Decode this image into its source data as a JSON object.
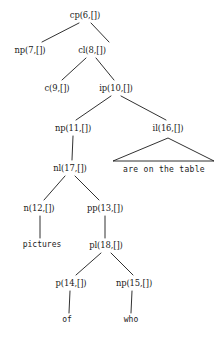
{
  "figure": {
    "type": "syntax-parse-tree",
    "width": 219,
    "height": 338,
    "background": "#ffffff",
    "line_color": "#1a1a1a",
    "text_color": "#1a1a1a"
  },
  "nodes": {
    "cp6": {
      "label": "cp(6,[])",
      "x": 85,
      "y": 15
    },
    "np7": {
      "label": "np(7,[])",
      "x": 30,
      "y": 50
    },
    "cl8": {
      "label": "cl(8,[])",
      "x": 92,
      "y": 50
    },
    "c9": {
      "label": "c(9,[])",
      "x": 57,
      "y": 88
    },
    "ip10": {
      "label": "ip(10,[])",
      "x": 116,
      "y": 88
    },
    "np11": {
      "label": "np(11,[])",
      "x": 73,
      "y": 128
    },
    "il16": {
      "label": "il(16,[])",
      "x": 168,
      "y": 128
    },
    "nl17": {
      "label": "nl(17,[])",
      "x": 70,
      "y": 168
    },
    "n12": {
      "label": "n(12,[])",
      "x": 39,
      "y": 208
    },
    "pp13": {
      "label": "pp(13,[])",
      "x": 105,
      "y": 208
    },
    "pictures": {
      "label": "pictures",
      "x": 42,
      "y": 245
    },
    "pl18": {
      "label": "pl(18,[])",
      "x": 106,
      "y": 245
    },
    "p14": {
      "label": "p(14,[])",
      "x": 71,
      "y": 283
    },
    "np15": {
      "label": "np(15,[])",
      "x": 134,
      "y": 283
    },
    "of": {
      "label": "of",
      "x": 67,
      "y": 320
    },
    "who": {
      "label": "who",
      "x": 131,
      "y": 320
    }
  },
  "phrase_triangle": {
    "text": "are on the table",
    "apex_x": 168,
    "apex_y": 138,
    "base_left_x": 113,
    "base_right_x": 214,
    "base_y": 161,
    "text_x": 164,
    "text_y": 170
  },
  "edges": [
    {
      "from": "cp6",
      "to": "np7"
    },
    {
      "from": "cp6",
      "to": "cl8"
    },
    {
      "from": "cl8",
      "to": "c9"
    },
    {
      "from": "cl8",
      "to": "ip10"
    },
    {
      "from": "ip10",
      "to": "np11"
    },
    {
      "from": "ip10",
      "to": "il16"
    },
    {
      "from": "np11",
      "to": "nl17"
    },
    {
      "from": "nl17",
      "to": "n12"
    },
    {
      "from": "nl17",
      "to": "pp13"
    },
    {
      "from": "n12",
      "to": "pictures"
    },
    {
      "from": "pp13",
      "to": "pl18"
    },
    {
      "from": "pl18",
      "to": "p14"
    },
    {
      "from": "pl18",
      "to": "np15"
    },
    {
      "from": "p14",
      "to": "of"
    },
    {
      "from": "np15",
      "to": "who"
    }
  ],
  "lines": [
    {
      "name": "edge-cp6-np7",
      "x1": 79,
      "y1": 23,
      "x2": 42,
      "y2": 42
    },
    {
      "name": "edge-cp6-cl8",
      "x1": 91,
      "y1": 23,
      "x2": 109,
      "y2": 42
    },
    {
      "name": "edge-cl8-c9",
      "x1": 86,
      "y1": 58,
      "x2": 62,
      "y2": 80
    },
    {
      "name": "edge-cl8-ip10",
      "x1": 96,
      "y1": 58,
      "x2": 114,
      "y2": 80
    },
    {
      "name": "edge-ip10-np11",
      "x1": 111,
      "y1": 96,
      "x2": 76,
      "y2": 120
    },
    {
      "name": "edge-ip10-il16",
      "x1": 121,
      "y1": 96,
      "x2": 166,
      "y2": 120
    },
    {
      "name": "edge-np11-nl17",
      "x1": 73,
      "y1": 136,
      "x2": 72,
      "y2": 160
    },
    {
      "name": "edge-nl17-n12",
      "x1": 65,
      "y1": 176,
      "x2": 44,
      "y2": 200
    },
    {
      "name": "edge-nl17-pp13",
      "x1": 75,
      "y1": 176,
      "x2": 99,
      "y2": 200
    },
    {
      "name": "edge-n12-pictures",
      "x1": 40,
      "y1": 216,
      "x2": 40,
      "y2": 238
    },
    {
      "name": "edge-pp13-pl18",
      "x1": 105,
      "y1": 216,
      "x2": 105,
      "y2": 238
    },
    {
      "name": "edge-pl18-p14",
      "x1": 101,
      "y1": 253,
      "x2": 76,
      "y2": 275
    },
    {
      "name": "edge-pl18-np15",
      "x1": 111,
      "y1": 253,
      "x2": 133,
      "y2": 275
    },
    {
      "name": "edge-p14-of",
      "x1": 70,
      "y1": 291,
      "x2": 69,
      "y2": 313
    },
    {
      "name": "edge-np15-who",
      "x1": 132,
      "y1": 291,
      "x2": 131,
      "y2": 313
    }
  ]
}
